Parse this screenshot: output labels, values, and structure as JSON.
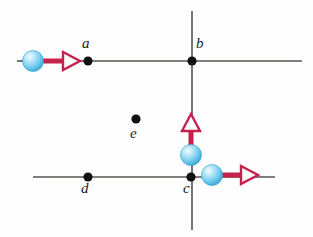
{
  "figure": {
    "background_color": "#fefefe",
    "width": 313,
    "height": 237
  },
  "style": {
    "line_color": "#55544f",
    "line_width": 1.6,
    "dot_color": "#111111",
    "dot_radius": 4.6,
    "label_color": "#1a1a1a",
    "arrow_color": "#c5214c",
    "arrow_head_fill": "#ffffff",
    "sphere_color": "#7fd2f2",
    "sphere_highlight": "#e8f8ff",
    "sphere_edge": "#3aa8d4",
    "sphere_radius": 10.5
  },
  "lines": [
    {
      "name": "horizontal-line-top",
      "x1": 21,
      "y1": 61,
      "x2": 302,
      "y2": 61
    },
    {
      "name": "vertical-line-right",
      "x1": 192,
      "y1": 11,
      "x2": 192,
      "y2": 230
    },
    {
      "name": "horizontal-line-bottom",
      "x1": 33,
      "y1": 177,
      "x2": 275,
      "y2": 177
    }
  ],
  "points": [
    {
      "id": "a",
      "label": "a",
      "x": 88,
      "y": 61,
      "label_x": 82,
      "label_y": 36
    },
    {
      "id": "b",
      "label": "b",
      "x": 192,
      "y": 61,
      "label_x": 196,
      "label_y": 36
    },
    {
      "id": "e",
      "label": "e",
      "x": 136,
      "y": 119,
      "label_x": 130,
      "label_y": 126
    },
    {
      "id": "c",
      "label": "c",
      "x": 191,
      "y": 177,
      "label_x": 183,
      "label_y": 181
    },
    {
      "id": "d",
      "label": "d",
      "x": 88,
      "y": 177,
      "label_x": 81,
      "label_y": 181
    }
  ],
  "spheres": [
    {
      "name": "sphere-left-moving-right",
      "cx": 33,
      "cy": 61,
      "r": 10.5
    },
    {
      "name": "sphere-below-b-moving-up",
      "cx": 191,
      "cy": 155,
      "r": 10.5
    },
    {
      "name": "sphere-right-of-c-moving-right",
      "cx": 212,
      "cy": 175,
      "r": 10.5
    }
  ],
  "arrows": [
    {
      "name": "velocity-arrow-left-sphere",
      "direction": "right",
      "shaft_x1": 44,
      "shaft_y1": 61,
      "shaft_x2": 62,
      "shaft_y2": 61,
      "tip_x": 80,
      "tip_y": 61
    },
    {
      "name": "velocity-arrow-vertical-sphere",
      "direction": "up",
      "shaft_x1": 191,
      "shaft_y1": 146,
      "shaft_x2": 191,
      "shaft_y2": 132,
      "tip_x": 191,
      "tip_y": 115
    },
    {
      "name": "velocity-arrow-right-sphere",
      "direction": "right",
      "shaft_x1": 223,
      "shaft_y1": 175,
      "shaft_x2": 240,
      "shaft_y2": 175,
      "tip_x": 258,
      "tip_y": 175
    }
  ],
  "stub": {
    "name": "charge-sign-stub",
    "x1": 17,
    "y1": 61,
    "x2": 23,
    "y2": 61
  }
}
